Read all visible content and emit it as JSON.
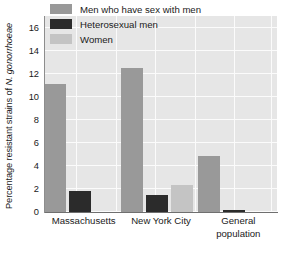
{
  "chart_data": {
    "type": "bar",
    "title": "",
    "subtitle": "",
    "xlabel": "",
    "ylabel": "Percentage resistant strains of N. gonorrhoeae",
    "ylabel_parts": {
      "plain": "Percentage resistant strains of ",
      "italic": "N. gonorrhoeae"
    },
    "categories": [
      "Massachusetts",
      "New York City",
      "General population"
    ],
    "category_lines": [
      [
        "Massachusetts"
      ],
      [
        "New York City"
      ],
      [
        "General",
        "population"
      ]
    ],
    "series": [
      {
        "name": "Men who have sex with men",
        "color": "#999999",
        "values": [
          11.1,
          12.5,
          4.9
        ]
      },
      {
        "name": "Heterosexual men",
        "color": "#2b2b2b",
        "values": [
          1.8,
          1.5,
          0.2
        ]
      },
      {
        "name": "Women",
        "color": "#c4c4c4",
        "values": [
          null,
          2.3,
          null
        ]
      }
    ],
    "ylim": [
      0,
      17.0
    ],
    "yticks": [
      0,
      2,
      4,
      6,
      8,
      10,
      12,
      14,
      16
    ],
    "ytick_labels": [
      "0",
      "2",
      "4",
      "6",
      "8",
      "10",
      "12",
      "14",
      "16"
    ],
    "grid": true,
    "grid_color": "#fbfbfb",
    "plot_background": "#e6e6e6",
    "legend_position": "top-center-inside",
    "legend": [
      {
        "label": "Men who have sex with men",
        "color": "#999999"
      },
      {
        "label": "Heterosexual men",
        "color": "#2b2b2b"
      },
      {
        "label": "Women",
        "color": "#c4c4c4"
      }
    ]
  }
}
